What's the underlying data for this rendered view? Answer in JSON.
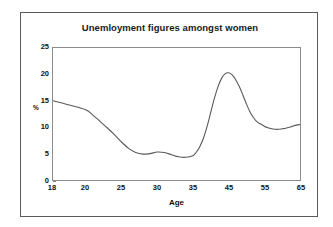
{
  "chart_data": {
    "type": "line",
    "title": "Unemloyment figures amongst women",
    "xlabel": "Age",
    "ylabel": "%",
    "grid": false,
    "legend": null,
    "xlim": [
      18,
      65
    ],
    "ylim": [
      0,
      25
    ],
    "ytick_labels": [
      "25",
      "20",
      "15",
      "10",
      "5",
      "0"
    ],
    "ytick_values": [
      25,
      20,
      15,
      10,
      5,
      0
    ],
    "xtick_labels": [
      "18",
      "20",
      "25",
      "30",
      "35",
      "45",
      "55",
      "65"
    ],
    "xtick_values": [
      18,
      20,
      25,
      30,
      35,
      45,
      55,
      65
    ],
    "series": [
      {
        "name": "Unemployment rate amongst women",
        "color": "#595959",
        "x": [
          18,
          19,
          20,
          21,
          22,
          23,
          24,
          25,
          26,
          27,
          28,
          29,
          30,
          31,
          32,
          33,
          34,
          35,
          36,
          37,
          38,
          39,
          40,
          41,
          42,
          43,
          44,
          45,
          46,
          47,
          48,
          49,
          50,
          51,
          52,
          53,
          54,
          55,
          56,
          57,
          58,
          59,
          60,
          61,
          62,
          63,
          64,
          65
        ],
        "values": [
          15.0,
          14.2,
          13.3,
          12.3,
          11.1,
          9.9,
          8.6,
          7.2,
          6.0,
          5.2,
          4.9,
          5.0,
          5.3,
          5.2,
          4.8,
          4.4,
          4.3,
          4.6,
          5.3,
          6.4,
          8.0,
          10.2,
          12.8,
          15.4,
          17.6,
          19.2,
          20.1,
          20.3,
          19.9,
          19.0,
          17.7,
          16.1,
          14.4,
          12.9,
          11.8,
          11.0,
          10.6,
          10.2,
          9.9,
          9.7,
          9.6,
          9.6,
          9.7,
          9.8,
          10.0,
          10.2,
          10.4,
          10.5
        ]
      }
    ]
  },
  "axes": {
    "y_label": "%",
    "x_label": "Age"
  }
}
